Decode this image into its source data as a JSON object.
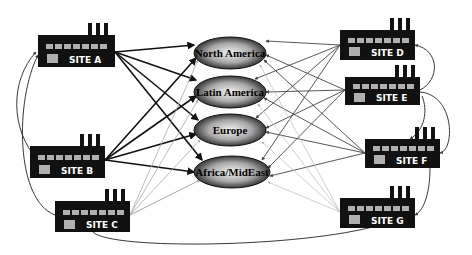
{
  "diagram": {
    "type": "supply-network",
    "sites": [
      {
        "id": "A",
        "label": "SITE A",
        "x": 38,
        "y": 35,
        "w": 77,
        "h": 32
      },
      {
        "id": "B",
        "label": "SITE B",
        "x": 30,
        "y": 146,
        "w": 75,
        "h": 32
      },
      {
        "id": "C",
        "label": "SITE C",
        "x": 55,
        "y": 201,
        "w": 75,
        "h": 31
      },
      {
        "id": "D",
        "label": "SITE D",
        "x": 340,
        "y": 30,
        "w": 75,
        "h": 30
      },
      {
        "id": "E",
        "label": "SITE E",
        "x": 345,
        "y": 77,
        "w": 75,
        "h": 28
      },
      {
        "id": "F",
        "label": "SITE F",
        "x": 365,
        "y": 139,
        "w": 75,
        "h": 29
      },
      {
        "id": "G",
        "label": "SITE G",
        "x": 340,
        "y": 198,
        "w": 75,
        "h": 30
      }
    ],
    "regions": [
      {
        "id": "NA",
        "label": "North America",
        "cx": 230,
        "cy": 53,
        "rx": 36,
        "ry": 16
      },
      {
        "id": "LA",
        "label": "Latin America",
        "cx": 230,
        "cy": 92,
        "rx": 36,
        "ry": 16
      },
      {
        "id": "EU",
        "label": "Europe",
        "cx": 230,
        "cy": 130,
        "rx": 36,
        "ry": 16
      },
      {
        "id": "AF",
        "label": "Africa/MidEast",
        "cx": 232,
        "cy": 172,
        "rx": 38,
        "ry": 16
      }
    ],
    "colors": {
      "site_fill": "#111111",
      "site_window": "#b0b0b0",
      "site_text": "#ffffff",
      "region_dark": "#1a1a1a",
      "region_light": "#e8e8e8",
      "edge_heavy": "#111111",
      "edge_medium": "#444444",
      "edge_light": "#aaaaaa"
    }
  }
}
